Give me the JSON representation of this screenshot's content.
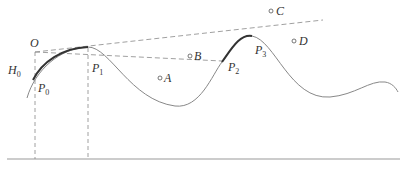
{
  "diagram": {
    "labels": {
      "O": "O",
      "H0": "H",
      "H0_sub": "0",
      "P0": "P",
      "P0_sub": "0",
      "P1": "P",
      "P1_sub": "1",
      "P2": "P",
      "P2_sub": "2",
      "P3": "P",
      "P3_sub": "3",
      "A": "A",
      "B": "B",
      "C": "C",
      "D": "D"
    },
    "colors": {
      "curve": "#888888",
      "thick_curve": "#333333",
      "dashed": "#888888",
      "ground": "#999999",
      "text": "#333333"
    }
  }
}
